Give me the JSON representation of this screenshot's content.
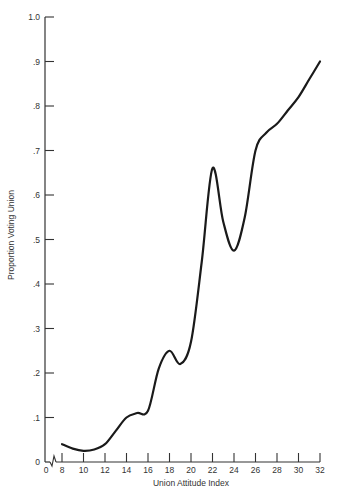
{
  "chart_data": {
    "type": "line",
    "title": "",
    "xlabel": "Union Attitude Index",
    "ylabel": "Proportion Voting Union",
    "xlim": [
      8,
      32
    ],
    "ylim": [
      0,
      1.0
    ],
    "x_axis_break": true,
    "x_ticks": [
      "0",
      "8",
      "10",
      "12",
      "14",
      "16",
      "18",
      "20",
      "22",
      "24",
      "26",
      "28",
      "30",
      "32"
    ],
    "y_ticks": [
      "0",
      ".1",
      ".2",
      ".3",
      ".4",
      ".5",
      ".6",
      ".7",
      ".8",
      ".9",
      "1.0"
    ],
    "grid": false,
    "legend": null,
    "series": [
      {
        "name": "Proportion Voting Union",
        "x": [
          8,
          9,
          10,
          11,
          12,
          13,
          14,
          15,
          16,
          17,
          18,
          19,
          20,
          21,
          22,
          23,
          24,
          25,
          26,
          27,
          28,
          29,
          30,
          31,
          32
        ],
        "y": [
          0.04,
          0.03,
          0.025,
          0.028,
          0.04,
          0.07,
          0.1,
          0.11,
          0.115,
          0.21,
          0.25,
          0.22,
          0.27,
          0.45,
          0.66,
          0.54,
          0.475,
          0.55,
          0.7,
          0.74,
          0.76,
          0.79,
          0.82,
          0.86,
          0.9
        ]
      }
    ]
  }
}
